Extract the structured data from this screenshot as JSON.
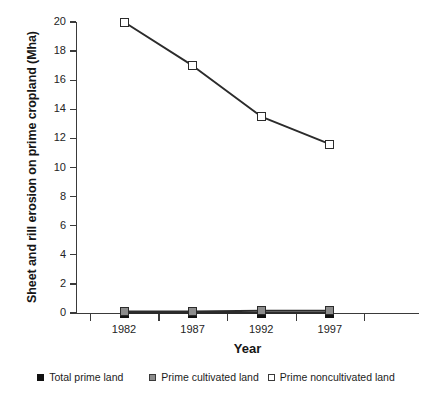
{
  "chart_data": {
    "type": "line",
    "title": "",
    "xlabel": "Year",
    "ylabel": "Sheet and rill erosion on prime cropland (Mha)",
    "categories": [
      "1982",
      "1987",
      "1992",
      "1997"
    ],
    "x": [
      1982,
      1987,
      1992,
      1997
    ],
    "series": [
      {
        "name": "Total prime land",
        "marker": "filled-black-square",
        "color": "#111111",
        "values": [
          0.0,
          0.0,
          0.0,
          0.0
        ]
      },
      {
        "name": "Prime cultivated land",
        "marker": "filled-gray-square",
        "color": "#8c8c8c",
        "values": [
          0.1,
          0.1,
          0.15,
          0.15
        ]
      },
      {
        "name": "Prime noncultivated land",
        "marker": "open-white-square",
        "color": "#ffffff",
        "values": [
          20.0,
          17.0,
          13.5,
          11.6
        ]
      }
    ],
    "ylim": [
      0,
      20
    ],
    "yticks": [
      0,
      2,
      4,
      6,
      8,
      10,
      12,
      14,
      16,
      18,
      20
    ],
    "ytick_labels": [
      "0",
      "2",
      "4",
      "6",
      "8",
      "10",
      "12",
      "14",
      "16",
      "18",
      "20"
    ],
    "xtick_labels": [
      "1982",
      "1987",
      "1992",
      "1997"
    ],
    "grid": false,
    "legend_position": "bottom",
    "line_color": "#2b2b2b"
  },
  "axes": {
    "y_title": "Sheet and rill erosion on prime cropland (Mha)",
    "x_title": "Year"
  },
  "legend": {
    "items": [
      {
        "label": "Total prime land",
        "swatch": "black-square-icon"
      },
      {
        "label": "Prime cultivated land",
        "swatch": "gray-square-icon"
      },
      {
        "label": "Prime noncultivated land",
        "swatch": "white-square-icon"
      }
    ]
  }
}
